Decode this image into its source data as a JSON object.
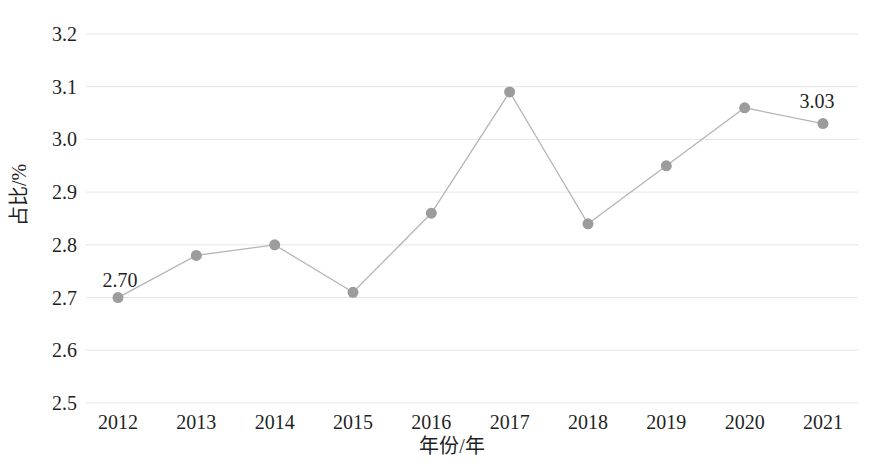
{
  "chart_data": {
    "type": "line",
    "title": "",
    "xlabel": "年份/年",
    "ylabel": "占比/%",
    "categories": [
      "2012",
      "2013",
      "2014",
      "2015",
      "2016",
      "2017",
      "2018",
      "2019",
      "2020",
      "2021"
    ],
    "series": [
      {
        "name": "占比",
        "values": [
          2.7,
          2.78,
          2.8,
          2.71,
          2.86,
          3.09,
          2.84,
          2.95,
          3.06,
          3.03
        ]
      }
    ],
    "ylim": [
      2.5,
      3.2
    ],
    "yticks": [
      3.2,
      3.1,
      3.0,
      2.9,
      2.8,
      2.7,
      2.6,
      2.5
    ],
    "ytick_labels": [
      "3.2",
      "3.1",
      "3.0",
      "2.9",
      "2.8",
      "2.7",
      "2.6",
      "2.5"
    ],
    "grid": "horizontal",
    "legend": "none",
    "point_labels": [
      {
        "index": 0,
        "text": "2.70",
        "dx": 2,
        "dy": -11
      },
      {
        "index": 9,
        "text": "3.03",
        "dx": -6,
        "dy": -16
      }
    ],
    "colors": {
      "line": "#b5b5b5",
      "marker": "#9c9c9c",
      "gridline": "#e5e5e5",
      "text": "#1f1f1f"
    }
  }
}
